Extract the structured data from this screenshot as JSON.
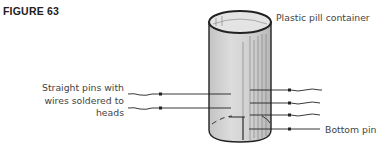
{
  "figure": {
    "title": "FIGURE 63"
  },
  "labels": {
    "container": "Plastic pill container",
    "pins_line1": "Straight pins with",
    "pins_line2": "wires soldered to",
    "pins_line3": "heads",
    "bottom_pin": "Bottom pin"
  },
  "colors": {
    "cylinder_fill": "#d6d6d6",
    "outline": "#222222",
    "text": "#444444"
  }
}
